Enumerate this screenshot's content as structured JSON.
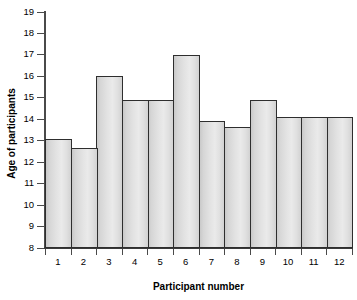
{
  "chart_data": {
    "type": "bar",
    "title": "",
    "xlabel": "Participant number",
    "ylabel": "Age of participants",
    "categories": [
      "1",
      "2",
      "3",
      "4",
      "5",
      "6",
      "7",
      "8",
      "9",
      "10",
      "11",
      "12"
    ],
    "values": [
      13.1,
      12.65,
      16.0,
      14.9,
      14.9,
      17.0,
      13.9,
      13.65,
      14.9,
      14.1,
      14.1,
      14.1
    ],
    "ylim": [
      8,
      19
    ],
    "ytick_labels": [
      "8",
      "9",
      "10",
      "11",
      "12",
      "13",
      "14",
      "15",
      "16",
      "17",
      "18",
      "19"
    ],
    "ytick_values": [
      8,
      9,
      10,
      11,
      12,
      13,
      14,
      15,
      16,
      17,
      18,
      19
    ],
    "grid": false,
    "legend": false,
    "bar_fill": "#e0e0e0",
    "bar_border": "#2e2e2e",
    "axis_color": "#4a4a4a",
    "background": "#ffffff"
  }
}
